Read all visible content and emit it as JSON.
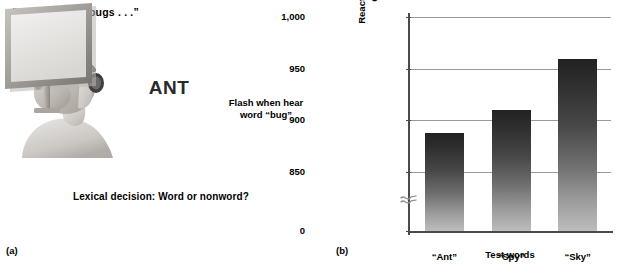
{
  "panel_a": {
    "label": "(a)",
    "speech_bubble": "“. . . and other bugs . . .”",
    "screen_word": "ANT",
    "flash_note_line1": "Flash when hear",
    "flash_note_line2": "word “bug”",
    "caption": "Lexical decision: Word or nonword?",
    "person_description": "listener-with-headphones",
    "monitor_description": "display-screen"
  },
  "panel_b": {
    "label": "(b)",
    "ylabel_line1": "Reaction time to lexical",
    "ylabel_line2": "decision (ms)",
    "xlabel": "Test words",
    "axis_break_symbol": "axis-break-squiggle"
  },
  "chart_data": {
    "type": "bar",
    "title": "",
    "categories": [
      "“Ant”",
      "“Spy”",
      "“Sky”"
    ],
    "values": [
      888,
      910,
      959
    ],
    "xlabel": "Test words",
    "ylabel": "Reaction time to lexical decision (ms)",
    "ytick_labels": [
      "0",
      "850",
      "900",
      "950",
      "1,000"
    ],
    "ytick_values": [
      0,
      850,
      900,
      950,
      1000
    ],
    "ylim": [
      840,
      1000
    ],
    "y_axis_broken": true,
    "grid": "horizontal",
    "legend": "none",
    "bar_fill": "vertical-gradient-dark-top-to-light-bottom",
    "colors": {
      "bar_top": "#222222",
      "bar_bottom": "#bdbdbd",
      "gridline": "#9a9a9a",
      "axis": "#4a4a4a"
    }
  }
}
